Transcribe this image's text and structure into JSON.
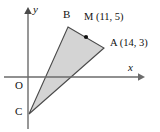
{
  "figure": {
    "type": "coordinate-geometry-diagram",
    "background_color": "#ffffff"
  },
  "axes": {
    "x_label": "x",
    "y_label": "y",
    "origin_label": "O",
    "axis_color": "#6b6b6b",
    "origin_px": {
      "x": 28,
      "y": 77
    },
    "x_axis": {
      "x1": 4,
      "y1": 77,
      "x2": 142,
      "y2": 77,
      "arrow": "right"
    },
    "y_axis": {
      "x1": 28,
      "y1": 128,
      "x2": 28,
      "y2": 9,
      "arrow": "up"
    }
  },
  "shape": {
    "name": "triangle",
    "fill_color": "#d4d4d4",
    "stroke_color": "#4a4a4a",
    "vertices_px": [
      {
        "label": "B",
        "x": 68,
        "y": 27
      },
      {
        "label": "A",
        "x": 104,
        "y": 48
      },
      {
        "label": "C",
        "x": 29,
        "y": 114
      }
    ]
  },
  "points": [
    {
      "id": "B",
      "label": "B",
      "has_coords": false,
      "coords_text": "",
      "marker": false,
      "px": {
        "x": 68,
        "y": 27
      }
    },
    {
      "id": "M",
      "label": "M",
      "has_coords": true,
      "coords_text": "M (11, 5)",
      "coords": {
        "x": 11,
        "y": 5
      },
      "marker": true,
      "px": {
        "x": 86,
        "y": 37
      }
    },
    {
      "id": "A",
      "label": "A",
      "has_coords": true,
      "coords_text": "A (14, 3)",
      "coords": {
        "x": 14,
        "y": 3
      },
      "marker": false,
      "px": {
        "x": 104,
        "y": 48
      }
    },
    {
      "id": "C",
      "label": "C",
      "has_coords": false,
      "coords_text": "",
      "marker": false,
      "px": {
        "x": 29,
        "y": 114
      }
    }
  ],
  "labels": {
    "B": "B",
    "M": "M (11, 5)",
    "A": "A (14, 3)",
    "C": "C",
    "O": "O",
    "x": "x",
    "y": "y"
  }
}
